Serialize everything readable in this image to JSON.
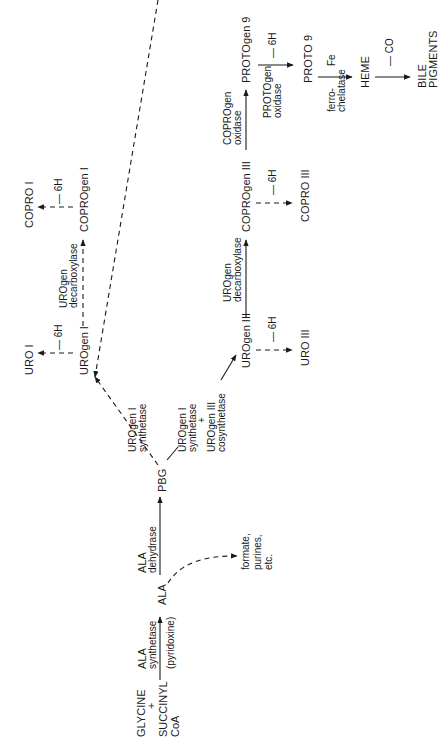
{
  "orientation": "rotated 90° counter-clockwise",
  "nodes": {
    "start_line1": "GLYCINE",
    "start_plus": "+",
    "start_line2": "SUCCINYL",
    "start_line3": "CoA",
    "ala": "ALA",
    "side_products_1": "formate,",
    "side_products_2": "purines,",
    "side_products_3": "etc.",
    "pbg": "PBG",
    "urogen_i": "UROgen I",
    "uro_i": "URO I",
    "coprogen_i": "COPROgen I",
    "copro_i": "COPRO I",
    "urogen_iii": "UROgen III",
    "uro_iii": "URO III",
    "coprogen_iii": "COPROgen III",
    "copro_iii": "COPRO III",
    "protogen_9": "PROTOgen 9",
    "proto_9": "PROTO 9",
    "heme": "HEME",
    "bile_1": "BILE",
    "bile_2": "PIGMENTS"
  },
  "enzymes": {
    "ala_synthetase_1": "ALA",
    "ala_synthetase_2": "synthetase",
    "cofactor": "(pyridoxine)",
    "ala_dehydrase_1": "ALA",
    "ala_dehydrase_2": "dehydrase",
    "urogen_i_synthetase_1": "UROgen I",
    "urogen_i_synthetase_2": "synthetase",
    "combo_1": "UROgen I",
    "combo_2": "synthetase",
    "combo_plus": "+",
    "combo_3": "UROgen III",
    "combo_4": "cosynthetase",
    "decarboxylase_i_1": "UROgen",
    "decarboxylase_i_2": "decarboxylase",
    "decarboxylase_iii_1": "UROgen",
    "decarboxylase_iii_2": "decarboxylase",
    "coprogen_oxidase_1": "COPROgen",
    "coprogen_oxidase_2": "oxidase",
    "protogen_oxidase_1": "PROTOgen",
    "protogen_oxidase_2": "oxidase",
    "ferrochelatase_1": "ferro-",
    "ferrochelatase_2": "chelatase"
  },
  "reactions": {
    "minus_6h": "— 6H",
    "fe": "Fe",
    "minus_co": "— CO"
  }
}
